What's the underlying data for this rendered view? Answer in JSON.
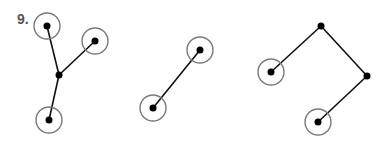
{
  "problem": {
    "number": "9."
  },
  "style": {
    "edge_color": "#111111",
    "node_color": "#000000",
    "ring_color": "#7a7a7a",
    "ring_radius": 13,
    "node_radius": 3.5
  },
  "graphs": [
    {
      "name": "graph-1",
      "nodes": [
        {
          "id": "a",
          "x": 47,
          "y": 26,
          "ringed": true
        },
        {
          "id": "b",
          "x": 95,
          "y": 41,
          "ringed": true
        },
        {
          "id": "c",
          "x": 59,
          "y": 75,
          "ringed": false
        },
        {
          "id": "d",
          "x": 49,
          "y": 120,
          "ringed": true
        }
      ],
      "edges": [
        [
          "a",
          "c"
        ],
        [
          "b",
          "c"
        ],
        [
          "c",
          "d"
        ]
      ]
    },
    {
      "name": "graph-2",
      "nodes": [
        {
          "id": "a",
          "x": 200,
          "y": 50,
          "ringed": true
        },
        {
          "id": "b",
          "x": 153,
          "y": 108,
          "ringed": true
        }
      ],
      "edges": [
        [
          "a",
          "b"
        ]
      ]
    },
    {
      "name": "graph-3",
      "nodes": [
        {
          "id": "a",
          "x": 271,
          "y": 72,
          "ringed": true
        },
        {
          "id": "b",
          "x": 321,
          "y": 26,
          "ringed": false
        },
        {
          "id": "c",
          "x": 367,
          "y": 76,
          "ringed": false
        },
        {
          "id": "d",
          "x": 318,
          "y": 122,
          "ringed": true
        }
      ],
      "edges": [
        [
          "a",
          "b"
        ],
        [
          "b",
          "c"
        ],
        [
          "c",
          "d"
        ]
      ]
    }
  ]
}
